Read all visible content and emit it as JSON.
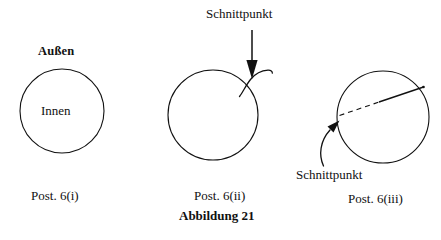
{
  "figure": {
    "caption": "Abbildung 21",
    "background_color": "#ffffff",
    "stroke_color": "#111111",
    "panels": [
      {
        "id": "panel-i",
        "caption": "Post. 6(i)",
        "labels": {
          "outside": "Außen",
          "inside": "Innen"
        },
        "circle": {
          "cx": 62,
          "cy": 111,
          "r": 42
        },
        "annotations": []
      },
      {
        "id": "panel-ii",
        "caption": "Post. 6(ii)",
        "labels": {
          "intersection": "Schnittpunkt"
        },
        "circle": {
          "cx": 213,
          "cy": 115,
          "r": 45
        },
        "annotations": [
          {
            "name": "crossing-curve",
            "kind": "s-curve"
          },
          {
            "name": "pointer-arrow",
            "kind": "straight-arrow",
            "direction": "down"
          }
        ]
      },
      {
        "id": "panel-iii",
        "caption": "Post. 6(iii)",
        "labels": {
          "intersection": "Schnittpunkt"
        },
        "circle": {
          "cx": 383,
          "cy": 117,
          "r": 46
        },
        "annotations": [
          {
            "name": "chord-dashed-segment",
            "kind": "dashed-line"
          },
          {
            "name": "chord-solid-segment",
            "kind": "solid-line"
          },
          {
            "name": "pointer-arrow",
            "kind": "curved-arrow",
            "direction": "up-right"
          }
        ]
      }
    ]
  }
}
